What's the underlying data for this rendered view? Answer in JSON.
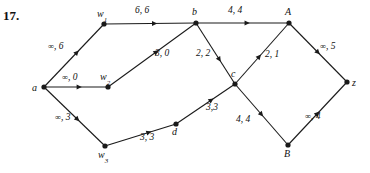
{
  "exercise": {
    "number": "17."
  },
  "colors": {
    "ink": "#111111",
    "edge": "#1a1a1a",
    "background": "#ffffff"
  },
  "graph": {
    "nodes": [
      {
        "id": "a",
        "label": "a",
        "sub": "",
        "x": 44,
        "y": 87,
        "label_x": 32,
        "label_y": 83
      },
      {
        "id": "w1",
        "label": "w",
        "sub": "1",
        "x": 104,
        "y": 24,
        "label_x": 97,
        "label_y": 9
      },
      {
        "id": "w2",
        "label": "w",
        "sub": "2",
        "x": 108,
        "y": 87,
        "label_x": 100,
        "label_y": 72
      },
      {
        "id": "w3",
        "label": "w",
        "sub": "3",
        "x": 105,
        "y": 146,
        "label_x": 98,
        "label_y": 150
      },
      {
        "id": "b",
        "label": "b",
        "sub": "",
        "x": 196,
        "y": 23,
        "label_x": 192,
        "label_y": 7
      },
      {
        "id": "c",
        "label": "c",
        "sub": "",
        "x": 235,
        "y": 84,
        "label_x": 231,
        "label_y": 69
      },
      {
        "id": "d",
        "label": "d",
        "sub": "",
        "x": 176,
        "y": 124,
        "label_x": 172,
        "label_y": 127
      },
      {
        "id": "A",
        "label": "A",
        "sub": "",
        "x": 289,
        "y": 23,
        "label_x": 285,
        "label_y": 7
      },
      {
        "id": "B",
        "label": "B",
        "sub": "",
        "x": 288,
        "y": 145,
        "label_x": 284,
        "label_y": 149
      },
      {
        "id": "z",
        "label": "z",
        "sub": "",
        "x": 347,
        "y": 82,
        "label_x": 352,
        "label_y": 78
      }
    ],
    "edges": [
      {
        "from": "a",
        "to": "w1",
        "capacity": "∞",
        "flow": "6",
        "label": "∞, 6",
        "label_x": 48,
        "label_y": 42,
        "arrow_t": 0.55
      },
      {
        "from": "a",
        "to": "w2",
        "capacity": "∞",
        "flow": "0",
        "label": "∞, 0",
        "label_x": 62,
        "label_y": 73,
        "arrow_t": 0.55
      },
      {
        "from": "a",
        "to": "w3",
        "capacity": "∞",
        "flow": "3",
        "label": "∞, 3",
        "label_x": 55,
        "label_y": 113,
        "arrow_t": 0.55
      },
      {
        "from": "w1",
        "to": "b",
        "capacity": "6",
        "flow": "6",
        "label": "6, 6",
        "label_x": 135,
        "label_y": 6,
        "arrow_t": 0.55
      },
      {
        "from": "w2",
        "to": "b",
        "capacity": "3",
        "flow": "0",
        "label": "3, 0",
        "label_x": 155,
        "label_y": 49,
        "arrow_t": 0.55
      },
      {
        "from": "b",
        "to": "A",
        "capacity": "4",
        "flow": "4",
        "label": "4, 4",
        "label_x": 228,
        "label_y": 6,
        "arrow_t": 0.55
      },
      {
        "from": "b",
        "to": "c",
        "capacity": "2",
        "flow": "2",
        "label": "2, 2",
        "label_x": 196,
        "label_y": 49,
        "arrow_t": 0.6
      },
      {
        "from": "c",
        "to": "A",
        "capacity": "2",
        "flow": "1",
        "label": "2, 1",
        "label_x": 265,
        "label_y": 50,
        "arrow_t": 0.45
      },
      {
        "from": "w3",
        "to": "d",
        "capacity": "3",
        "flow": "3",
        "label": "3, 3",
        "label_x": 140,
        "label_y": 133,
        "arrow_t": 0.62
      },
      {
        "from": "d",
        "to": "c",
        "capacity": "3",
        "flow": "3",
        "label": "3,3",
        "label_x": 206,
        "label_y": 103,
        "arrow_t": 0.6
      },
      {
        "from": "c",
        "to": "B",
        "capacity": "4",
        "flow": "4",
        "label": "4, 4",
        "label_x": 236,
        "label_y": 115,
        "arrow_t": 0.5
      },
      {
        "from": "A",
        "to": "z",
        "capacity": "∞",
        "flow": "5",
        "label": "∞, 5",
        "label_x": 320,
        "label_y": 42,
        "arrow_t": 0.5
      },
      {
        "from": "B",
        "to": "z",
        "capacity": "∞",
        "flow": "4",
        "label": "∞, 4",
        "label_x": 305,
        "label_y": 112,
        "arrow_t": 0.5
      }
    ]
  }
}
